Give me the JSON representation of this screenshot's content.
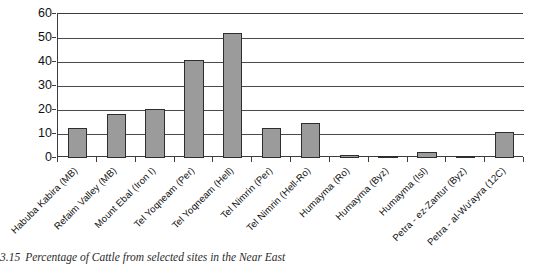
{
  "caption": {
    "figure_number": "3.15",
    "text": "Percentage of Cattle from selected sites in the Near East"
  },
  "chart_data": {
    "type": "bar",
    "title": "",
    "subtitle": "",
    "xlabel": "",
    "ylabel": "",
    "ylim": [
      0,
      60
    ],
    "ytick_values": [
      0,
      10,
      20,
      30,
      40,
      50,
      60
    ],
    "ytick_labels": [
      "0",
      "10",
      "20",
      "30",
      "40",
      "50",
      "60"
    ],
    "grid": true,
    "grid_axis": "y",
    "legend": false,
    "legend_position": "none",
    "bar_fill_color": "#9b9b9b",
    "bar_edge_color": "#2e2e2e",
    "axis_color": "#3c3c3c",
    "categories": [
      "Habuba Kabira (MB)",
      "Refaim Valley (MB)",
      "Mount Ebal (Iron I)",
      "Tel Yoqneam (Per)",
      "Tel Yoqneam (Hell)",
      "Tel Nimrin (Per)",
      "Tel Nimrin (Hell-Ro)",
      "Humayma (Ro)",
      "Humayma (Byz)",
      "Humayma (Isl)",
      "Petra - ez-Zantur (Byz)",
      "Petra - al-Wu'ayra (12C)"
    ],
    "values": [
      12.3,
      18.3,
      20.6,
      40.7,
      52.0,
      12.5,
      14.5,
      1.2,
      0.6,
      2.3,
      0.8,
      11.0
    ],
    "series": [
      {
        "name": "Percentage of Cattle",
        "values": [
          12.3,
          18.3,
          20.6,
          40.7,
          52.0,
          12.5,
          14.5,
          1.2,
          0.6,
          2.3,
          0.8,
          11.0
        ]
      }
    ]
  }
}
